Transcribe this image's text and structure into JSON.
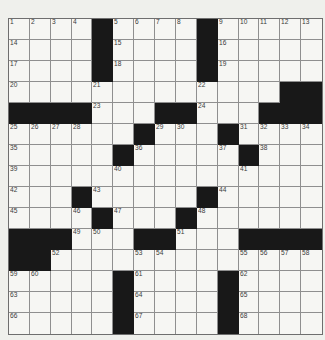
{
  "puzzle": {
    "type": "crossword",
    "rows": 15,
    "cols": 15,
    "legend": {
      "black": -1,
      "empty_white": 0,
      "numbered_white": "positive integer shown in cell"
    },
    "cells": [
      [
        1,
        2,
        3,
        4,
        -1,
        5,
        6,
        7,
        8,
        -1,
        9,
        10,
        11,
        12,
        13
      ],
      [
        14,
        0,
        0,
        0,
        -1,
        15,
        0,
        0,
        0,
        -1,
        16,
        0,
        0,
        0,
        0
      ],
      [
        17,
        0,
        0,
        0,
        -1,
        18,
        0,
        0,
        0,
        -1,
        19,
        0,
        0,
        0,
        0
      ],
      [
        20,
        0,
        0,
        0,
        21,
        0,
        0,
        0,
        0,
        22,
        0,
        0,
        0,
        -1,
        -1
      ],
      [
        -1,
        -1,
        -1,
        -1,
        23,
        0,
        0,
        -1,
        -1,
        24,
        0,
        0,
        -1,
        -1,
        -1
      ],
      [
        25,
        26,
        27,
        28,
        0,
        0,
        -1,
        29,
        30,
        0,
        -1,
        31,
        32,
        33,
        34
      ],
      [
        35,
        0,
        0,
        0,
        0,
        -1,
        36,
        0,
        0,
        0,
        37,
        -1,
        38,
        0,
        0
      ],
      [
        39,
        0,
        0,
        0,
        0,
        40,
        0,
        0,
        0,
        0,
        0,
        41,
        0,
        0,
        0
      ],
      [
        42,
        0,
        0,
        -1,
        43,
        0,
        0,
        0,
        0,
        -1,
        44,
        0,
        0,
        0,
        0
      ],
      [
        45,
        0,
        0,
        46,
        -1,
        47,
        0,
        0,
        -1,
        48,
        0,
        0,
        0,
        0,
        0
      ],
      [
        -1,
        -1,
        -1,
        49,
        50,
        0,
        -1,
        -1,
        51,
        0,
        0,
        -1,
        -1,
        -1,
        -1
      ],
      [
        -1,
        -1,
        52,
        0,
        0,
        0,
        53,
        54,
        0,
        0,
        0,
        55,
        56,
        57,
        58
      ],
      [
        59,
        60,
        0,
        0,
        0,
        -1,
        61,
        0,
        0,
        0,
        -1,
        62,
        0,
        0,
        0
      ],
      [
        63,
        0,
        0,
        0,
        0,
        -1,
        64,
        0,
        0,
        0,
        -1,
        65,
        0,
        0,
        0
      ],
      [
        66,
        0,
        0,
        0,
        0,
        -1,
        67,
        0,
        0,
        0,
        -1,
        68,
        0,
        0,
        0
      ]
    ]
  },
  "colors": {
    "page_bg": "#eff0ec",
    "cell_bg": "#f6f6f3",
    "black_cell": "#181818",
    "grid_line": "#8f8f8f",
    "outer_border": "#6e6e6e",
    "number_color": "#3a3a3a"
  }
}
